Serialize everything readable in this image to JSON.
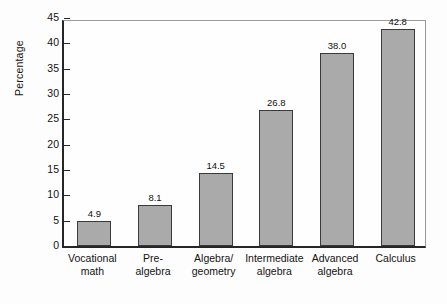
{
  "chart_data": {
    "type": "bar",
    "title": "",
    "subtitle": "",
    "xlabel": "",
    "ylabel": "Percentage",
    "ylim": [
      0,
      45
    ],
    "ytick_values": [
      0,
      5,
      10,
      15,
      20,
      25,
      30,
      35,
      40,
      45
    ],
    "ytick_labels": [
      "0",
      "5",
      "10",
      "15",
      "20",
      "25",
      "30",
      "35",
      "40",
      "45"
    ],
    "grid": false,
    "legend": false,
    "legend_position": "none",
    "bar_color": "#aaaaaa",
    "bar_edge_color": "#3a3a3a",
    "axis_color": "#262626",
    "frame_color": "#9a9a9a",
    "background_color": "#fdfdfd",
    "categories": [
      "Vocational\nmath",
      "Pre-\nalgebra",
      "Algebra/\ngeometry",
      "Intermediate\nalgebra",
      "Advanced\nalgebra",
      "Calculus"
    ],
    "values": [
      4.9,
      8.1,
      14.5,
      26.8,
      38.0,
      42.8
    ],
    "data_labels": [
      "4.9",
      "8.1",
      "14.5",
      "26.8",
      "38.0",
      "42.8"
    ]
  }
}
